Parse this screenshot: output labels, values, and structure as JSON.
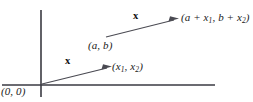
{
  "figure": {
    "background_color": "#ffffff",
    "line_color": "#4a4a52",
    "axis_color": "#3a3a42",
    "text_color": "#1a1a1a"
  },
  "axes": {
    "vertical": {
      "x": 41,
      "y_top": 10,
      "y_bottom": 97
    },
    "horizontal": {
      "y": 85,
      "x_left": 2,
      "x_right": 215
    }
  },
  "labels": {
    "origin": "(0, 0)",
    "point_x": "(x",
    "point_x_sub1": "1",
    "point_x_mid": ", x",
    "point_x_sub2": "2",
    "point_x_end": ")",
    "point_ab": "(a, b)",
    "point_sum_open": "(a + x",
    "point_sum_sub1": "1",
    "point_sum_mid": ", b + x",
    "point_sum_sub2": "2",
    "point_sum_close": ")",
    "vector_lower": "x",
    "vector_upper": "x"
  },
  "vectors": [
    {
      "name": "vector-from-origin",
      "label": "x",
      "tail": [
        42,
        84
      ],
      "head": [
        110,
        67
      ],
      "tail_point_label": "(0, 0)",
      "head_point_label": "(x1, x2)"
    },
    {
      "name": "vector-translated",
      "label": "x",
      "tail": [
        106,
        37
      ],
      "head": [
        177,
        19
      ],
      "tail_point_label": "(a, b)",
      "head_point_label": "(a + x1, b + x2)"
    }
  ]
}
